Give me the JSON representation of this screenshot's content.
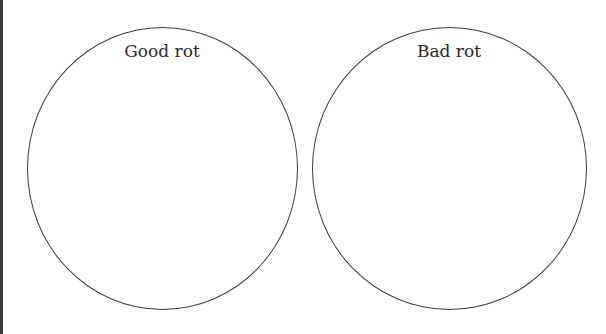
{
  "diagram": {
    "type": "two-circle sorting organizer",
    "circles": [
      {
        "label": "Good rot"
      },
      {
        "label": "Bad rot"
      }
    ]
  },
  "colors": {
    "stroke": "#3c3c3c",
    "text": "#2a2a2a",
    "background": "#ffffff",
    "edge_bar": "#3a3a3a"
  }
}
